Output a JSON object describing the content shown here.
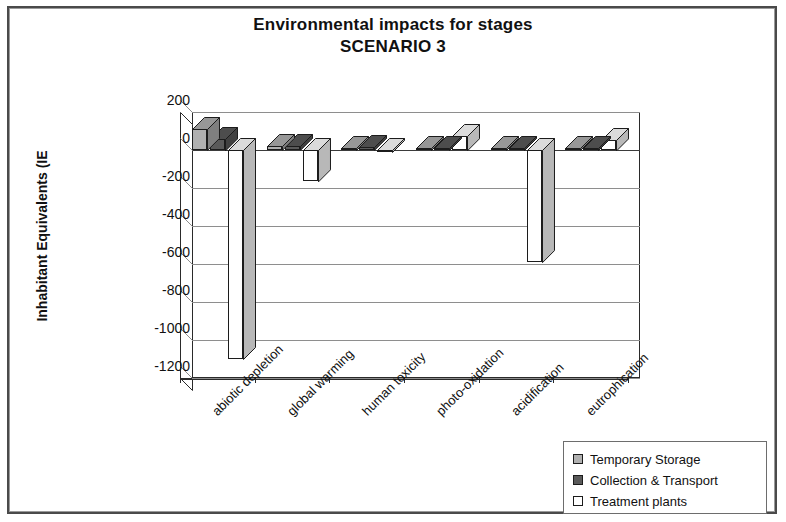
{
  "chart_data": {
    "type": "bar",
    "title": "Environmental impacts for stages",
    "subtitle": "SCENARIO 3",
    "xlabel": "",
    "ylabel": "Inhabitant Equivalents (IE",
    "ylim": [
      -1200,
      200
    ],
    "ytick_step": 200,
    "yticks": [
      200,
      0,
      -200,
      -400,
      -600,
      -800,
      -1000,
      -1200
    ],
    "ytick_labels": [
      "200",
      "0",
      "-200",
      "-400",
      "-600",
      "-800",
      "-1000",
      "-1200"
    ],
    "grid": true,
    "legend_position": "bottom-right",
    "style": "3d-clustered-column",
    "categories": [
      "abiotic depletion",
      "global warming",
      "human toxicity",
      "photo-oxidation",
      "acidification",
      "eutrophication"
    ],
    "series": [
      {
        "name": "Temporary Storage",
        "color": "#b0b0b0",
        "values": [
          110,
          20,
          10,
          10,
          10,
          10
        ]
      },
      {
        "name": "Collection & Transport",
        "color": "#5a5a5a",
        "values": [
          60,
          20,
          15,
          10,
          10,
          10
        ]
      },
      {
        "name": "Treatment plants",
        "color": "#ffffff",
        "values": [
          -1100,
          -165,
          -10,
          75,
          -590,
          55
        ]
      }
    ]
  },
  "legend": {
    "items": [
      {
        "label": "Temporary Storage",
        "color": "#b0b0b0"
      },
      {
        "label": "Collection & Transport",
        "color": "#5a5a5a"
      },
      {
        "label": "Treatment plants",
        "color": "#ffffff"
      }
    ]
  },
  "axis": {
    "y_title": "Inhabitant Equivalents (IE"
  }
}
